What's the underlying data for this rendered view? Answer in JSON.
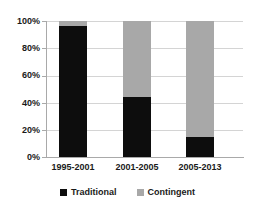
{
  "chart_data": {
    "type": "bar",
    "subtype": "stacked-100-percent",
    "title": "",
    "xlabel": "",
    "ylabel": "",
    "ylim": [
      0,
      100
    ],
    "yticks": [
      "0%",
      "20%",
      "40%",
      "60%",
      "80%",
      "100%"
    ],
    "ytick_values": [
      0,
      20,
      40,
      60,
      80,
      100
    ],
    "grid": true,
    "legend_position": "bottom",
    "categories": [
      "1995-2001",
      "2001-2005",
      "2005-2013"
    ],
    "series": [
      {
        "name": "Traditional",
        "color": "#0d0d0d",
        "values": [
          96,
          44,
          15
        ]
      },
      {
        "name": "Contingent",
        "color": "#a8a8a8",
        "values": [
          4,
          56,
          85
        ]
      }
    ]
  },
  "axis": {
    "y_tick_0": "0%",
    "y_tick_1": "20%",
    "y_tick_2": "40%",
    "y_tick_3": "60%",
    "y_tick_4": "80%",
    "y_tick_5": "100%"
  },
  "categories": {
    "cat_0": "1995-2001",
    "cat_1": "2001-2005",
    "cat_2": "2005-2013"
  },
  "legend": {
    "item_0_label": "Traditional",
    "item_1_label": "Contingent"
  },
  "colors": {
    "traditional": "#0d0d0d",
    "contingent": "#a8a8a8",
    "gridline": "#d4d4d4",
    "axis": "#a9a9a9",
    "text": "#1a1a1a",
    "background": "#ffffff"
  }
}
